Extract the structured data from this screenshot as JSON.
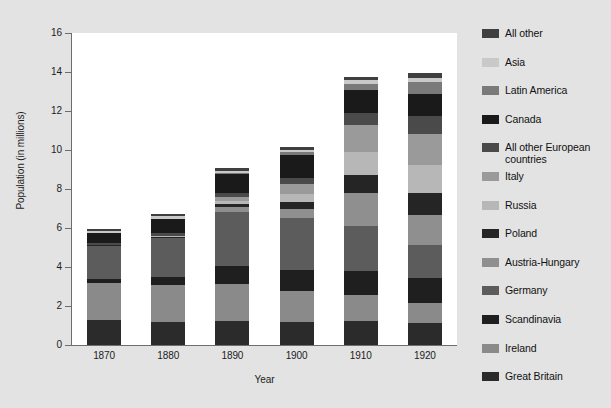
{
  "chart_data": {
    "type": "bar",
    "subtype": "stacked-bar",
    "title": "",
    "xlabel": "Year",
    "ylabel": "Population (in millions)",
    "categories": [
      "1870",
      "1880",
      "1890",
      "1900",
      "1910",
      "1920"
    ],
    "ylim": [
      0,
      16
    ],
    "ytick_labels": [
      "0",
      "2",
      "4",
      "6",
      "8",
      "10",
      "12",
      "14",
      "16"
    ],
    "ytick_values": [
      0,
      2,
      4,
      6,
      8,
      10,
      12,
      14,
      16
    ],
    "grid": false,
    "legend_position": "right",
    "stack_order_bottom_to_top": [
      "Great Britain",
      "Ireland",
      "Scandinavia",
      "Germany",
      "Austria-Hungary",
      "Poland",
      "Russia",
      "Italy",
      "All other European countries",
      "Canada",
      "Latin America",
      "Asia",
      "All other"
    ],
    "series": [
      {
        "name": "Great Britain",
        "color": "#2b2b2b",
        "values": [
          1.3,
          1.2,
          1.25,
          1.17,
          1.22,
          1.14
        ]
      },
      {
        "name": "Ireland",
        "color": "#8a8a8a",
        "values": [
          1.86,
          1.86,
          1.87,
          1.62,
          1.35,
          1.04
        ]
      },
      {
        "name": "Scandinavia",
        "color": "#1f1f1f",
        "values": [
          0.24,
          0.44,
          0.93,
          1.07,
          1.25,
          1.26
        ]
      },
      {
        "name": "Germany",
        "color": "#5c5c5c",
        "values": [
          1.69,
          1.97,
          2.78,
          2.66,
          2.31,
          1.69
        ]
      },
      {
        "name": "Austria-Hungary",
        "color": "#8f8f8f",
        "values": [
          0.0,
          0.01,
          0.24,
          0.44,
          1.67,
          1.55
        ]
      },
      {
        "name": "Poland",
        "color": "#252525",
        "values": [
          0.02,
          0.05,
          0.15,
          0.38,
          0.94,
          1.14
        ]
      },
      {
        "name": "Russia",
        "color": "#b7b7b7",
        "values": [
          0.0,
          0.04,
          0.18,
          0.42,
          1.18,
          1.4
        ]
      },
      {
        "name": "Italy",
        "color": "#9a9a9a",
        "values": [
          0.02,
          0.04,
          0.18,
          0.48,
          1.34,
          1.61
        ]
      },
      {
        "name": "All other European countries",
        "color": "#4a4a4a",
        "values": [
          0.11,
          0.12,
          0.21,
          0.33,
          0.64,
          0.93
        ]
      },
      {
        "name": "Canada",
        "color": "#1a1a1a",
        "values": [
          0.49,
          0.72,
          0.98,
          1.18,
          1.2,
          1.13
        ]
      },
      {
        "name": "Latin America",
        "color": "#7a7a7a",
        "values": [
          0.03,
          0.04,
          0.06,
          0.14,
          0.28,
          0.59
        ]
      },
      {
        "name": "Asia",
        "color": "#c9c9c9",
        "values": [
          0.07,
          0.11,
          0.12,
          0.12,
          0.2,
          0.24
        ]
      },
      {
        "name": "All other",
        "color": "#3f3f3f",
        "values": [
          0.12,
          0.12,
          0.14,
          0.15,
          0.17,
          0.24
        ]
      }
    ],
    "totals": [
      5.95,
      6.92,
      9.09,
      10.16,
      13.35,
      14.46
    ]
  },
  "legend": {
    "items": [
      {
        "label": "All other",
        "color": "#3f3f3f"
      },
      {
        "label": "Asia",
        "color": "#c9c9c9"
      },
      {
        "label": "Latin America",
        "color": "#7a7a7a"
      },
      {
        "label": "Canada",
        "color": "#1a1a1a"
      },
      {
        "label": "All other European\ncountries",
        "color": "#4a4a4a"
      },
      {
        "label": "Italy",
        "color": "#9a9a9a"
      },
      {
        "label": "Russia",
        "color": "#b7b7b7"
      },
      {
        "label": "Poland",
        "color": "#252525"
      },
      {
        "label": "Austria-Hungary",
        "color": "#8f8f8f"
      },
      {
        "label": "Germany",
        "color": "#5c5c5c"
      },
      {
        "label": "Scandinavia",
        "color": "#1f1f1f"
      },
      {
        "label": "Ireland",
        "color": "#8a8a8a"
      },
      {
        "label": "Great Britain",
        "color": "#2b2b2b"
      }
    ]
  },
  "colors": {
    "figure_background": "#e3e3e3",
    "plot_background": "#ffffff",
    "axis": "#6d6d6d",
    "text": "#1c1c1c"
  }
}
